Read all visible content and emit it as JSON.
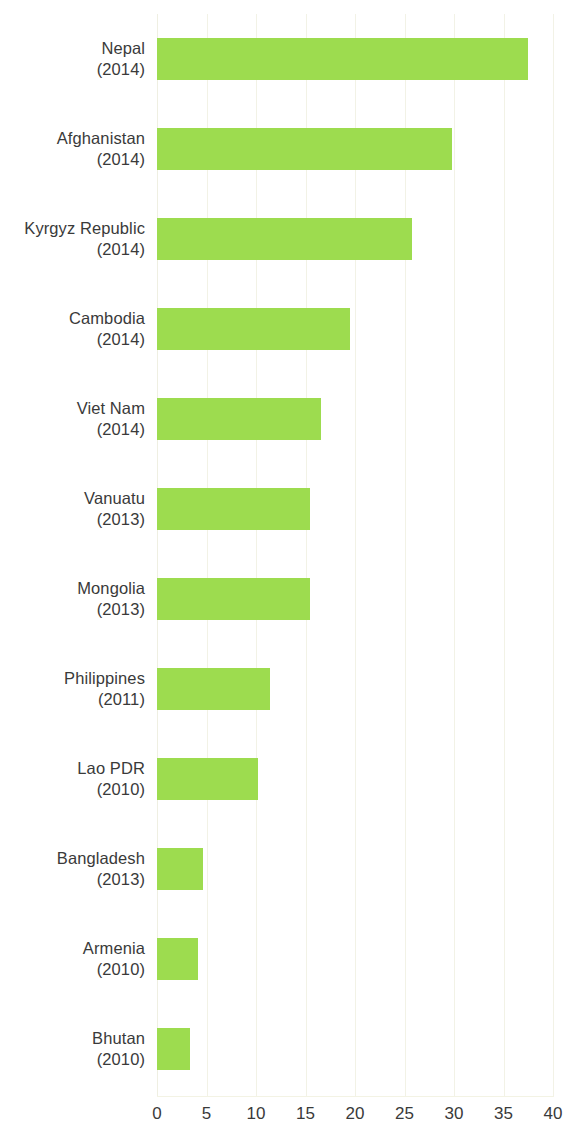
{
  "chart_data": {
    "type": "bar",
    "orientation": "horizontal",
    "title": "",
    "subtitle": "",
    "xlabel": "",
    "ylabel": "",
    "xlim": [
      0,
      40
    ],
    "xticks": [
      "0",
      "5",
      "10",
      "15",
      "20",
      "25",
      "30",
      "35",
      "40"
    ],
    "xtick_values": [
      0,
      5,
      10,
      15,
      20,
      25,
      30,
      35,
      40
    ],
    "grid": true,
    "grid_axis": "x",
    "legend": false,
    "legend_position": "none",
    "bar_color": "#9ddc4f",
    "gridline_color": "#f2f2e6",
    "text_color": "#3a3a3a",
    "background_color": "#ffffff",
    "categories": [
      "Nepal (2014)",
      "Afghanistan (2014)",
      "Kyrgyz Republic (2014)",
      "Cambodia (2014)",
      "Viet Nam (2014)",
      "Vanuatu (2013)",
      "Mongolia (2013)",
      "Philippines (2011)",
      "Lao PDR (2010)",
      "Bangladesh (2013)",
      "Armenia (2010)",
      "Bhutan (2010)"
    ],
    "values": [
      37.5,
      29.8,
      25.8,
      19.5,
      16.6,
      15.5,
      15.5,
      11.4,
      10.2,
      4.6,
      4.1,
      3.3
    ],
    "bars": [
      {
        "name": "Nepal",
        "year": "(2014)",
        "value": 37.5
      },
      {
        "name": "Afghanistan",
        "year": "(2014)",
        "value": 29.8
      },
      {
        "name": "Kyrgyz Republic",
        "year": "(2014)",
        "value": 25.8
      },
      {
        "name": "Cambodia",
        "year": "(2014)",
        "value": 19.5
      },
      {
        "name": "Viet Nam",
        "year": "(2014)",
        "value": 16.6
      },
      {
        "name": "Vanuatu",
        "year": "(2013)",
        "value": 15.5
      },
      {
        "name": "Mongolia",
        "year": "(2013)",
        "value": 15.5
      },
      {
        "name": "Philippines",
        "year": "(2011)",
        "value": 11.4
      },
      {
        "name": "Lao PDR",
        "year": "(2010)",
        "value": 10.2
      },
      {
        "name": "Bangladesh",
        "year": "(2013)",
        "value": 4.6
      },
      {
        "name": "Armenia",
        "year": "(2010)",
        "value": 4.1
      },
      {
        "name": "Bhutan",
        "year": "(2010)",
        "value": 3.3
      }
    ]
  }
}
